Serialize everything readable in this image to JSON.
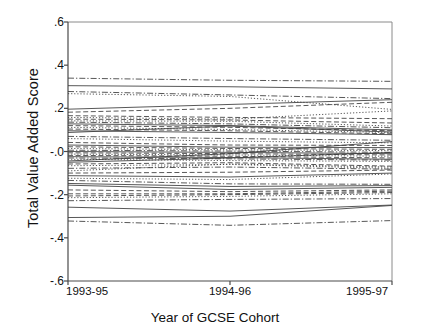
{
  "chart_data": {
    "type": "line",
    "title": "",
    "xlabel": "Year of GCSE Cohort",
    "ylabel": "Total Value Added Score",
    "categories": [
      "1993-95",
      "1994-96",
      "1995-97"
    ],
    "x": [
      0,
      1,
      2
    ],
    "ylim": [
      -0.6,
      0.6
    ],
    "yticks": [
      0.6,
      0.4,
      0.2,
      0.0,
      -0.2,
      -0.4,
      -0.6
    ],
    "ytick_labels": [
      ".6",
      ".4",
      ".2",
      "-.0",
      "-.2",
      "-.4",
      "-.6"
    ],
    "grid": false,
    "legend": null,
    "legend_position": "none",
    "line_color": "#3a3a3a",
    "series_note": "Each line is one school's trajectory across three GCSE cohorts (spaghetti plot, ~50 schools).",
    "series": [
      {
        "name": "school-01",
        "values": [
          0.34,
          0.33,
          0.325
        ],
        "style": "dashdot"
      },
      {
        "name": "school-02",
        "values": [
          0.305,
          0.3,
          0.29
        ],
        "style": "solid"
      },
      {
        "name": "school-03",
        "values": [
          0.278,
          0.262,
          0.245
        ],
        "style": "dashdot"
      },
      {
        "name": "school-04",
        "values": [
          0.268,
          0.255,
          0.195
        ],
        "style": "dotted"
      },
      {
        "name": "school-05",
        "values": [
          0.196,
          0.218,
          0.24
        ],
        "style": "solid"
      },
      {
        "name": "school-06",
        "values": [
          0.182,
          0.2,
          0.228
        ],
        "style": "dashed"
      },
      {
        "name": "school-07",
        "values": [
          0.166,
          0.158,
          0.152
        ],
        "style": "dashed"
      },
      {
        "name": "school-08",
        "values": [
          0.158,
          0.15,
          0.188
        ],
        "style": "dotted"
      },
      {
        "name": "school-09",
        "values": [
          0.15,
          0.146,
          0.132
        ],
        "style": "dashed"
      },
      {
        "name": "school-10",
        "values": [
          0.142,
          0.14,
          0.118
        ],
        "style": "dotted"
      },
      {
        "name": "school-11",
        "values": [
          0.136,
          0.128,
          0.11
        ],
        "style": "dashdot"
      },
      {
        "name": "school-12",
        "values": [
          0.128,
          0.12,
          0.1
        ],
        "style": "solid"
      },
      {
        "name": "school-13",
        "values": [
          0.12,
          0.112,
          0.096
        ],
        "style": "dashed"
      },
      {
        "name": "school-14",
        "values": [
          0.112,
          0.102,
          0.088
        ],
        "style": "dotted"
      },
      {
        "name": "school-15",
        "values": [
          0.104,
          0.096,
          0.082
        ],
        "style": "dashed"
      },
      {
        "name": "school-16",
        "values": [
          0.096,
          0.088,
          0.078
        ],
        "style": "solid"
      },
      {
        "name": "school-17",
        "values": [
          0.088,
          0.118,
          0.09
        ],
        "style": "solid"
      },
      {
        "name": "school-18",
        "values": [
          0.07,
          0.06,
          0.052
        ],
        "style": "dashdot"
      },
      {
        "name": "school-19",
        "values": [
          0.06,
          0.048,
          0.04
        ],
        "style": "dotted"
      },
      {
        "name": "school-20",
        "values": [
          0.042,
          0.03,
          0.028
        ],
        "style": "dashed"
      },
      {
        "name": "school-21",
        "values": [
          0.03,
          0.02,
          0.018
        ],
        "style": "solid"
      },
      {
        "name": "school-22",
        "values": [
          0.022,
          0.014,
          0.01
        ],
        "style": "dashed"
      },
      {
        "name": "school-23",
        "values": [
          0.014,
          0.008,
          0.004
        ],
        "style": "dotted"
      },
      {
        "name": "school-24",
        "values": [
          0.006,
          0.002,
          -0.004
        ],
        "style": "dashdot"
      },
      {
        "name": "school-25",
        "values": [
          0.0,
          -0.004,
          -0.01
        ],
        "style": "solid"
      },
      {
        "name": "school-26",
        "values": [
          -0.006,
          -0.01,
          -0.016
        ],
        "style": "dashed"
      },
      {
        "name": "school-27",
        "values": [
          -0.012,
          -0.016,
          -0.022
        ],
        "style": "dotted"
      },
      {
        "name": "school-28",
        "values": [
          -0.018,
          -0.022,
          -0.03
        ],
        "style": "dashed"
      },
      {
        "name": "school-29",
        "values": [
          -0.024,
          -0.028,
          -0.036
        ],
        "style": "solid"
      },
      {
        "name": "school-30",
        "values": [
          -0.03,
          -0.034,
          -0.04
        ],
        "style": "dashdot"
      },
      {
        "name": "school-31",
        "values": [
          -0.036,
          -0.042,
          -0.046
        ],
        "style": "dotted"
      },
      {
        "name": "school-32",
        "values": [
          -0.044,
          -0.01,
          0.046
        ],
        "style": "solid"
      },
      {
        "name": "school-33",
        "values": [
          -0.05,
          -0.03,
          -0.004
        ],
        "style": "solid"
      },
      {
        "name": "school-34",
        "values": [
          -0.058,
          -0.052,
          -0.068
        ],
        "style": "dashed"
      },
      {
        "name": "school-35",
        "values": [
          -0.066,
          -0.06,
          -0.078
        ],
        "style": "dotted"
      },
      {
        "name": "school-36",
        "values": [
          -0.078,
          -0.072,
          -0.082
        ],
        "style": "dashdot"
      },
      {
        "name": "school-37",
        "values": [
          -0.09,
          -0.058,
          -0.072
        ],
        "style": "dotted"
      },
      {
        "name": "school-38",
        "values": [
          -0.1,
          -0.096,
          -0.086
        ],
        "style": "dashed"
      },
      {
        "name": "school-39",
        "values": [
          -0.112,
          -0.118,
          -0.1
        ],
        "style": "solid"
      },
      {
        "name": "school-40",
        "values": [
          -0.124,
          -0.13,
          -0.104
        ],
        "style": "dotted"
      },
      {
        "name": "school-41",
        "values": [
          -0.134,
          -0.15,
          -0.152
        ],
        "style": "dashdot"
      },
      {
        "name": "school-42",
        "values": [
          -0.148,
          -0.162,
          -0.158
        ],
        "style": "solid"
      },
      {
        "name": "school-43",
        "values": [
          -0.156,
          -0.176,
          -0.166
        ],
        "style": "solid"
      },
      {
        "name": "school-44",
        "values": [
          -0.178,
          -0.186,
          -0.178
        ],
        "style": "dashed"
      },
      {
        "name": "school-45",
        "values": [
          -0.196,
          -0.196,
          -0.184
        ],
        "style": "dashed"
      },
      {
        "name": "school-46",
        "values": [
          -0.206,
          -0.2,
          -0.19
        ],
        "style": "dashed"
      },
      {
        "name": "school-47",
        "values": [
          -0.214,
          -0.208,
          -0.196
        ],
        "style": "dotted"
      },
      {
        "name": "school-48",
        "values": [
          -0.228,
          -0.222,
          -0.218
        ],
        "style": "dashdot"
      },
      {
        "name": "school-49",
        "values": [
          -0.258,
          -0.276,
          -0.248
        ],
        "style": "solid"
      },
      {
        "name": "school-50",
        "values": [
          -0.306,
          -0.3,
          -0.25
        ],
        "style": "solid"
      },
      {
        "name": "school-51",
        "values": [
          -0.322,
          -0.342,
          -0.32
        ],
        "style": "dashdot"
      }
    ]
  }
}
